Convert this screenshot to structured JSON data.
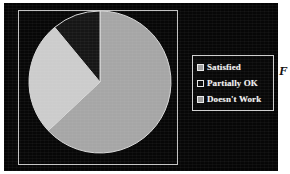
{
  "figure": {
    "background_color": "#070707",
    "plot_border_color": "#c2c2c2",
    "margin_glyph": "F"
  },
  "legend": {
    "border_color": "#cfcfcf",
    "text_color": "#f2f2f2",
    "entries": [
      {
        "label": "Satisfied",
        "swatch_color": "#a0a0a0"
      },
      {
        "label": "Partially OK",
        "swatch_color": "#0c0c0c"
      },
      {
        "label": "Doesn't Work",
        "swatch_color": "#9a9a9a"
      }
    ]
  },
  "chart_data": {
    "type": "pie",
    "title": "",
    "xlabel": "",
    "ylabel": "",
    "categories": [
      "Satisfied",
      "Partially OK",
      "Doesn't Work"
    ],
    "values": [
      63,
      26,
      11
    ],
    "unit": "%",
    "colors": [
      "#a6a6a6",
      "#cccccc",
      "#161616"
    ],
    "edge_color": "#d8d8d8",
    "start_angle_deg": 90,
    "direction": "clockwise",
    "legend_position": "right",
    "grid": false,
    "labels_on_slices": false,
    "center_px": {
      "x": 73,
      "y": 73
    },
    "radius_px": 71
  }
}
